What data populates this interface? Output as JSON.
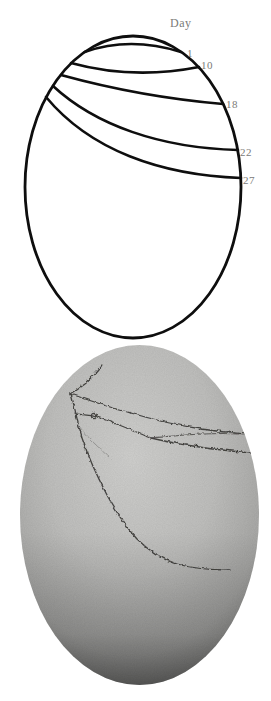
{
  "figure": {
    "panel_top": {
      "title": "Day",
      "labels": {
        "d1": "1",
        "d10": "10",
        "d18": "18",
        "d22": "22",
        "d27": "27"
      },
      "day_sequence": [
        "1",
        "10",
        "18",
        "22",
        "27"
      ]
    },
    "colors": {
      "background": "#ffffff",
      "line_black": "#0e0e0e",
      "label_gray": "#7b7b78",
      "crack": "#2e2d2b",
      "egg": {
        "g0": "#d0d0ce",
        "g1": "#c0c0be",
        "g2": "#a8a8a6",
        "g3": "#868684",
        "g4": "#676765"
      }
    }
  }
}
